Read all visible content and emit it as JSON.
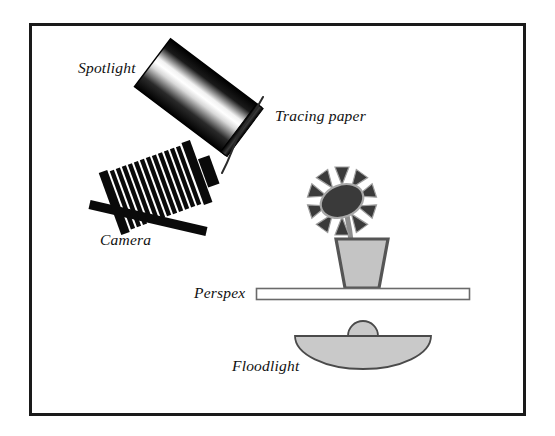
{
  "figure": {
    "background_color": "#ffffff",
    "border": {
      "name": "figure-border",
      "color": "#1a1a1a",
      "x": 29,
      "y": 23,
      "width": 496,
      "height": 392,
      "stroke_width": 3
    },
    "labels": {
      "spotlight": "Spotlight",
      "tracing_paper": "Tracing paper",
      "camera": "Camera",
      "perspex": "Perspex",
      "floodlight": "Floodlight"
    },
    "components": [
      {
        "name": "spotlight",
        "label": "Spotlight",
        "shape": "rotated-rectangle-gradient",
        "rotation_deg": 37,
        "gradient": [
          "#000000",
          "#ffffff",
          "#000000"
        ],
        "cx": 198,
        "cy": 97,
        "width": 110,
        "height": 58
      },
      {
        "name": "tracing-paper",
        "label": "Tracing paper",
        "shape": "wavy-line",
        "color": "#2b2b2b",
        "stroke_width": 2
      },
      {
        "name": "camera",
        "label": "Camera",
        "shape": "bellows-camera",
        "color": "#0a0a0a",
        "bellows_pleats": 13,
        "rotation_deg": -20
      },
      {
        "name": "flower",
        "shape": "flower-in-pot",
        "petal_count": 10,
        "head_color": "#3a3a3a",
        "head_outline": "#9a9a9a",
        "stem_color": "#8e8e8e",
        "pot_fill": "#c4c4c4",
        "pot_outline": "#555555"
      },
      {
        "name": "perspex-sheet",
        "label": "Perspex",
        "shape": "rectangle",
        "fill": "#ffffff",
        "outline": "#6a6a6a",
        "x": 256,
        "y": 288,
        "width": 214,
        "height": 12
      },
      {
        "name": "floodlight",
        "label": "Floodlight",
        "shape": "half-ellipse-bowl",
        "fill": "#c9c9c9",
        "outline": "#4a4a4a",
        "cx": 363,
        "cy": 336,
        "rx": 68,
        "ry": 32,
        "bulb_radius": 15
      }
    ]
  }
}
